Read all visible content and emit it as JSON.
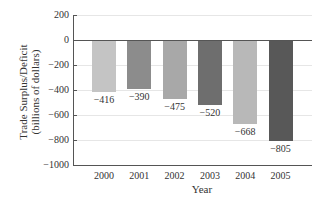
{
  "chart_data": {
    "type": "bar",
    "title": "",
    "xlabel": "Year",
    "ylabel": "Trade Surplus/Deficit (billions of dollars)",
    "ylabel_lines": [
      "Trade Surplus/Deficit",
      "(billions of dollars)"
    ],
    "categories": [
      "2000",
      "2001",
      "2002",
      "2003",
      "2004",
      "2005"
    ],
    "values": [
      -416,
      -390,
      -475,
      -520,
      -668,
      -805
    ],
    "value_labels": [
      "−416",
      "−390",
      "−475",
      "−520",
      "−668",
      "−805"
    ],
    "bar_colors": [
      "#c4c4c4",
      "#8c8c8c",
      "#a8a8a8",
      "#6e6e6e",
      "#b8b8b8",
      "#585858"
    ],
    "ylim": [
      -1000,
      200
    ],
    "yticks": [
      200,
      0,
      -200,
      -400,
      -600,
      -800,
      -1000
    ],
    "ytick_labels": [
      "200",
      "0",
      "−200",
      "−400",
      "−600",
      "−800",
      "−1000"
    ],
    "grid": true,
    "legend": null
  }
}
